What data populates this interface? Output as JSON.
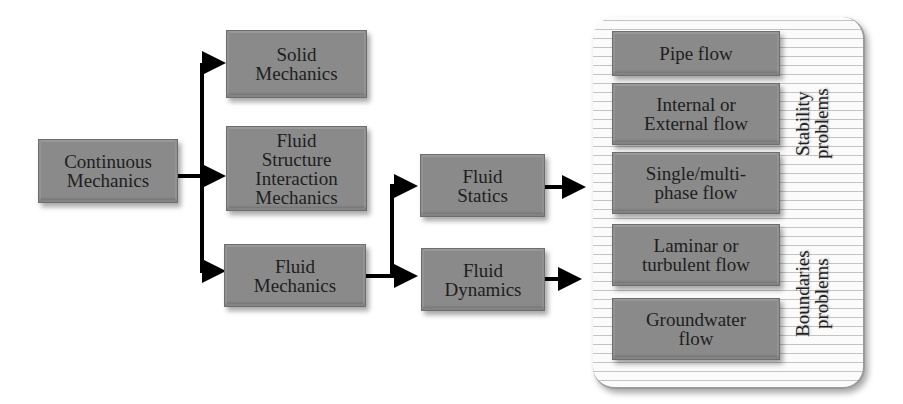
{
  "diagram": {
    "root": "Continuous\nMechanics",
    "level1": [
      "Solid\nMechanics",
      "Fluid\nStructure\nInteraction\nMechanics",
      "Fluid\nMechanics"
    ],
    "level2": [
      "Fluid\nStatics",
      "Fluid\nDynamics"
    ],
    "problems": [
      "Pipe flow",
      "Internal or\nExternal flow",
      "Single/multi-\nphase flow",
      "Laminar or\nturbulent flow",
      "Groundwater\nflow"
    ],
    "group_labels": {
      "stability": "Stability\nproblems",
      "boundaries": "Boundaries\nproblems"
    },
    "edges": [
      [
        "Continuous Mechanics",
        "Solid Mechanics"
      ],
      [
        "Continuous Mechanics",
        "Fluid Structure Interaction Mechanics"
      ],
      [
        "Continuous Mechanics",
        "Fluid Mechanics"
      ],
      [
        "Fluid Mechanics",
        "Fluid Statics"
      ],
      [
        "Fluid Mechanics",
        "Fluid Dynamics"
      ],
      [
        "Fluid Statics",
        "Problems group"
      ],
      [
        "Fluid Dynamics",
        "Problems group"
      ]
    ]
  }
}
